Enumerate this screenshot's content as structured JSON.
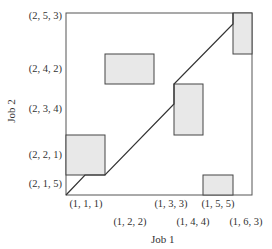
{
  "diagram": {
    "type": "progress-diagram",
    "x_axis": {
      "title": "Job 1",
      "ticks": [
        {
          "label": "(1, 1, 1)",
          "row": 1
        },
        {
          "label": "(1, 2, 2)",
          "row": 2
        },
        {
          "label": "(1, 3, 3)",
          "row": 1
        },
        {
          "label": "(1, 4, 4)",
          "row": 2
        },
        {
          "label": "(1, 5, 5)",
          "row": 1
        },
        {
          "label": "(1, 6, 3)",
          "row": 2
        }
      ]
    },
    "y_axis": {
      "title": "Job 2",
      "ticks": [
        {
          "label": "(2, 5, 3)"
        },
        {
          "label": "(2, 4, 2)"
        },
        {
          "label": "(2, 3, 4)"
        },
        {
          "label": "(2, 2, 1)"
        },
        {
          "label": "(2, 1, 5)"
        }
      ]
    },
    "forbidden_regions": [
      {
        "name": "region-1-2-2__2-2-1"
      },
      {
        "name": "region-1-2-2__2-4-2"
      },
      {
        "name": "region-1-4-4__2-3-4"
      },
      {
        "name": "region-1-5-5__2-1-5"
      },
      {
        "name": "region-1-6-3__2-5-3"
      }
    ],
    "colors": {
      "region_fill": "#e8e8e8",
      "stroke": "#444444"
    }
  }
}
